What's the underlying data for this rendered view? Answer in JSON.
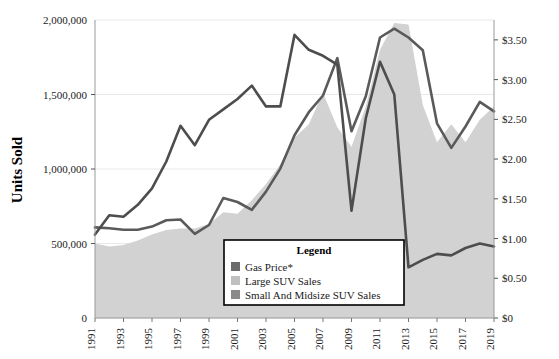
{
  "chart_data": {
    "type": "line",
    "title": "",
    "ylabel": "Units Sold",
    "xlabel": "",
    "grid": true,
    "legend_position": "inside-bottom-center",
    "x": [
      1991,
      1992,
      1993,
      1994,
      1995,
      1996,
      1997,
      1998,
      1999,
      2000,
      2001,
      2002,
      2003,
      2004,
      2005,
      2006,
      2007,
      2008,
      2009,
      2010,
      2011,
      2012,
      2013,
      2014,
      2015,
      2016,
      2017,
      2018,
      2019
    ],
    "x_tick_labels": [
      "1991",
      "1993",
      "1995",
      "1997",
      "1999",
      "2001",
      "2003",
      "2005",
      "2007",
      "2009",
      "2011",
      "2013",
      "2015",
      "2017",
      "2019"
    ],
    "left_axis": {
      "ylim": [
        0,
        2000000
      ],
      "ticks": [
        0,
        500000,
        1000000,
        1500000,
        2000000
      ],
      "tick_labels": [
        "0",
        "500,000",
        "1,000,000",
        "1,500,000",
        "2,000,000"
      ]
    },
    "right_axis": {
      "ylim": [
        0,
        3.75
      ],
      "ticks": [
        0,
        0.5,
        1.0,
        1.5,
        2.0,
        2.5,
        3.0,
        3.5
      ],
      "tick_labels": [
        "$0",
        "$0.50",
        "$1.00",
        "$1.50",
        "$2.00",
        "$2.50",
        "$3.00",
        "$3.50"
      ]
    },
    "series": [
      {
        "name": "Gas Price*",
        "axis": "right",
        "render": "line",
        "color": "#5a5a5a",
        "values": [
          1.14,
          1.13,
          1.11,
          1.11,
          1.15,
          1.23,
          1.24,
          1.06,
          1.17,
          1.51,
          1.46,
          1.36,
          1.59,
          1.88,
          2.3,
          2.59,
          2.8,
          3.27,
          2.35,
          2.79,
          3.53,
          3.64,
          3.53,
          3.37,
          2.45,
          2.14,
          2.41,
          2.72,
          2.6
        ]
      },
      {
        "name": "Large SUV Sales",
        "axis": "left",
        "render": "line",
        "color": "#4d4d4d",
        "values": [
          560000,
          690000,
          680000,
          760000,
          870000,
          1050000,
          1290000,
          1160000,
          1330000,
          1400000,
          1470000,
          1560000,
          1420000,
          1420000,
          1900000,
          1800000,
          1760000,
          1700000,
          720000,
          1340000,
          1720000,
          1500000,
          340000,
          390000,
          430000,
          420000,
          470000,
          500000,
          480000
        ]
      },
      {
        "name": "Small And Midsize SUV Sales",
        "axis": "left",
        "render": "area",
        "color": "#d2d2d2",
        "values": [
          500000,
          480000,
          490000,
          520000,
          560000,
          590000,
          600000,
          600000,
          630000,
          710000,
          700000,
          790000,
          900000,
          1030000,
          1210000,
          1300000,
          1510000,
          1280000,
          1150000,
          1420000,
          1800000,
          1980000,
          1970000,
          1430000,
          1180000,
          1300000,
          1180000,
          1330000,
          1420000
        ]
      }
    ]
  },
  "axis": {
    "y_title": "Units Sold",
    "left_ticks": [
      "2,000,000",
      "1,500,000",
      "1,000,000",
      "500,000",
      "0"
    ],
    "right_ticks": [
      "$3.50",
      "$3.00",
      "$2.50",
      "$2.00",
      "$1.50",
      "$1.00",
      "$0.50",
      "$0"
    ],
    "x_ticks": [
      "1991",
      "1993",
      "1995",
      "1997",
      "1999",
      "2001",
      "2003",
      "2005",
      "2007",
      "2009",
      "2011",
      "2013",
      "2015",
      "2017",
      "2019"
    ]
  },
  "legend": {
    "title": "Legend",
    "items": [
      {
        "label": "Gas Price*",
        "color": "#6b6b6b"
      },
      {
        "label": "Large SUV Sales",
        "color": "#c0c0c0"
      },
      {
        "label": "Small And Midsize SUV Sales",
        "color": "#8a8a8a"
      }
    ]
  },
  "colors": {
    "gas_price_line": "#5a5a5a",
    "large_suv_line": "#4d4d4d",
    "small_suv_area": "#d2d2d2",
    "grid": "#e8e8e8",
    "axis": "#9a9a9a"
  }
}
